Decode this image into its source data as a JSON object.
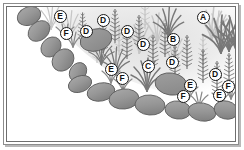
{
  "figure": {
    "kind": "labeled-planting-diagram",
    "background_color": "#ffffff",
    "frame_color": "#8c8c8c",
    "palette": {
      "rock_fill": "#9a9a9a",
      "rock_fill_dark": "#8a8a8a",
      "rock_outline": "#5f5f5f",
      "plant_dark": "#7d7d7d",
      "plant_mid": "#a6a6a6",
      "plant_light": "#c9c9c9",
      "haze": "#e4e4e4",
      "badge_text": "#111111",
      "badge_fill": "#ffffff"
    }
  },
  "callouts": [
    {
      "id": "a1",
      "label": "A",
      "x": 203,
      "y": 17,
      "plant": "grass-clump"
    },
    {
      "id": "b1",
      "label": "B",
      "x": 173,
      "y": 39,
      "plant": "bottlebrush-stem"
    },
    {
      "id": "c1",
      "label": "C",
      "x": 148,
      "y": 66,
      "plant": "grass-clump"
    },
    {
      "id": "d1",
      "label": "D",
      "x": 103,
      "y": 20,
      "plant": "bottlebrush-stem"
    },
    {
      "id": "d2",
      "label": "D",
      "x": 86,
      "y": 31,
      "plant": "bottlebrush-stem"
    },
    {
      "id": "d3",
      "label": "D",
      "x": 127,
      "y": 31,
      "plant": "bottlebrush-stem"
    },
    {
      "id": "d4",
      "label": "D",
      "x": 143,
      "y": 44,
      "plant": "bottlebrush-stem"
    },
    {
      "id": "d5",
      "label": "D",
      "x": 172,
      "y": 62,
      "plant": "bottlebrush-stem"
    },
    {
      "id": "d6",
      "label": "D",
      "x": 215,
      "y": 74,
      "plant": "bottlebrush-stem"
    },
    {
      "id": "e1",
      "label": "E",
      "x": 60,
      "y": 16,
      "plant": "low-tuft"
    },
    {
      "id": "e2",
      "label": "E",
      "x": 111,
      "y": 69,
      "plant": "low-tuft"
    },
    {
      "id": "e3",
      "label": "E",
      "x": 190,
      "y": 85,
      "plant": "low-tuft"
    },
    {
      "id": "e4",
      "label": "E",
      "x": 219,
      "y": 95,
      "plant": "low-tuft"
    },
    {
      "id": "f1",
      "label": "F",
      "x": 66,
      "y": 33,
      "plant": "ground-cover"
    },
    {
      "id": "f2",
      "label": "F",
      "x": 122,
      "y": 78,
      "plant": "ground-cover"
    },
    {
      "id": "f3",
      "label": "F",
      "x": 183,
      "y": 96,
      "plant": "ground-cover"
    },
    {
      "id": "f4",
      "label": "F",
      "x": 228,
      "y": 86,
      "plant": "ground-cover"
    }
  ],
  "rocks_upper_border": [
    {
      "cx": 29,
      "cy": 16,
      "rx": 12,
      "ry": 9,
      "rot": -22
    },
    {
      "cx": 39,
      "cy": 31,
      "rx": 12,
      "ry": 9,
      "rot": -40
    },
    {
      "cx": 51,
      "cy": 47,
      "rx": 11,
      "ry": 9,
      "rot": -45
    },
    {
      "cx": 63,
      "cy": 60,
      "rx": 12,
      "ry": 10,
      "rot": -48
    },
    {
      "cx": 78,
      "cy": 72,
      "rx": 10,
      "ry": 8,
      "rot": -55
    },
    {
      "cx": 96,
      "cy": 40,
      "rx": 16,
      "ry": 11,
      "rot": -14
    }
  ],
  "rocks_lower_border": [
    {
      "cx": 80,
      "cy": 84,
      "rx": 12,
      "ry": 8,
      "rot": -20
    },
    {
      "cx": 101,
      "cy": 92,
      "rx": 14,
      "ry": 9,
      "rot": -12
    },
    {
      "cx": 124,
      "cy": 99,
      "rx": 15,
      "ry": 10,
      "rot": -6
    },
    {
      "cx": 150,
      "cy": 105,
      "rx": 15,
      "ry": 10,
      "rot": 4
    },
    {
      "cx": 171,
      "cy": 84,
      "rx": 16,
      "ry": 11,
      "rot": 8
    },
    {
      "cx": 178,
      "cy": 110,
      "rx": 13,
      "ry": 9,
      "rot": 7
    },
    {
      "cx": 202,
      "cy": 112,
      "rx": 14,
      "ry": 9,
      "rot": 10
    },
    {
      "cx": 226,
      "cy": 110,
      "rx": 12,
      "ry": 9,
      "rot": 14
    }
  ]
}
